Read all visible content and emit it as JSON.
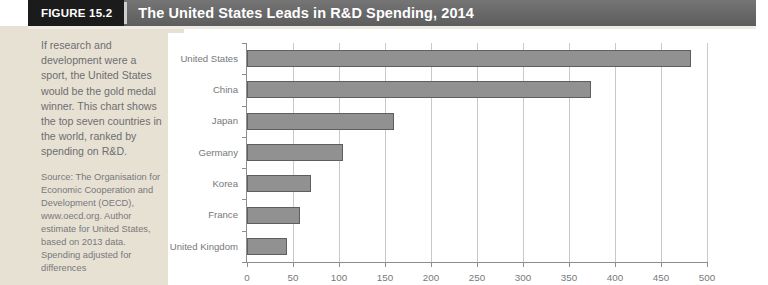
{
  "header": {
    "figure_tag": "FIGURE 15.2",
    "title": "The United States Leads in R&D Spending, 2014",
    "tag_bg": "#1b1b1b",
    "bar_bg": "#6b6b6b"
  },
  "caption": {
    "main": "If research and development were a sport, the United States would be the gold medal winner. This chart shows the top seven countries in the world, ranked by spending on R&D.",
    "source": "Source: The Organisation for Economic Cooperation and Development (OECD), www.oecd.org. Author estimate for United States, based on 2013 data. Spending adjusted for differences"
  },
  "chart_data": {
    "type": "bar",
    "orientation": "horizontal",
    "title": "The United States Leads in R&D Spending, 2014",
    "xlabel": "",
    "ylabel": "",
    "categories": [
      "United States",
      "China",
      "Japan",
      "Germany",
      "Korea",
      "France",
      "United Kingdom"
    ],
    "values": [
      483,
      374,
      160,
      104,
      70,
      58,
      44
    ],
    "xlim": [
      0,
      500
    ],
    "xticks": [
      0,
      50,
      100,
      150,
      200,
      250,
      300,
      350,
      400,
      450,
      500
    ],
    "xtick_labels": [
      "0",
      "50",
      "100",
      "150",
      "200",
      "250",
      "300",
      "350",
      "400",
      "450",
      "500"
    ],
    "grid": true,
    "grid_axis": "x",
    "legend": false,
    "bar_color": "#919191",
    "bar_border_color": "#5e5e5e",
    "gridline_color": "#c9c9c9",
    "axis_color": "#8d8d8d",
    "label_color": "#77787a",
    "plot_background": "#ffffff"
  },
  "colors": {
    "sidebar_bg": "#e7e1d4",
    "header_text": "#ffffff",
    "caption_text": "#6d6e70"
  }
}
